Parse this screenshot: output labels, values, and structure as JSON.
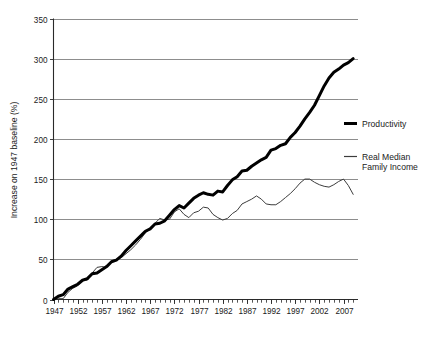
{
  "chart_data": {
    "type": "line",
    "title": "",
    "xlabel": "",
    "ylabel": "Increase on 1947 baseline (%)",
    "ylim": [
      0,
      350
    ],
    "xlim": [
      1947,
      2010
    ],
    "ytick_values": [
      0,
      50,
      100,
      150,
      200,
      250,
      300,
      350
    ],
    "ytick_labels": [
      "0",
      "50",
      "100",
      "150",
      "200",
      "250",
      "300",
      "350"
    ],
    "xtick_values": [
      1947,
      1952,
      1957,
      1962,
      1967,
      1972,
      1977,
      1982,
      1987,
      1992,
      1997,
      2002,
      2007
    ],
    "xtick_labels": [
      "1947",
      "1952",
      "1957",
      "1962",
      "1967",
      "1972",
      "1977",
      "1982",
      "1987",
      "1992",
      "1997",
      "2002",
      "2007"
    ],
    "minor_ticks": "every year",
    "grid": "horizontal",
    "legend_position": "right",
    "x": [
      1947,
      1948,
      1949,
      1950,
      1951,
      1952,
      1953,
      1954,
      1955,
      1956,
      1957,
      1958,
      1959,
      1960,
      1961,
      1962,
      1963,
      1964,
      1965,
      1966,
      1967,
      1968,
      1969,
      1970,
      1971,
      1972,
      1973,
      1974,
      1975,
      1976,
      1977,
      1978,
      1979,
      1980,
      1981,
      1982,
      1983,
      1984,
      1985,
      1986,
      1987,
      1988,
      1989,
      1990,
      1991,
      1992,
      1993,
      1994,
      1995,
      1996,
      1997,
      1998,
      1999,
      2000,
      2001,
      2002,
      2003,
      2004,
      2005,
      2006,
      2007,
      2008,
      2009
    ],
    "series": [
      {
        "name": "Productivity",
        "style": "thick-black",
        "color": "#000000",
        "values": [
          0,
          4,
          6,
          13,
          16,
          19,
          24,
          26,
          32,
          33,
          37,
          41,
          47,
          49,
          54,
          61,
          67,
          73,
          79,
          85,
          88,
          94,
          95,
          98,
          105,
          112,
          117,
          114,
          120,
          126,
          130,
          133,
          131,
          130,
          135,
          134,
          142,
          149,
          153,
          160,
          161,
          166,
          170,
          174,
          177,
          186,
          188,
          192,
          194,
          202,
          208,
          216,
          225,
          233,
          242,
          254,
          266,
          276,
          283,
          287,
          292,
          295,
          300
        ]
      },
      {
        "name": "Real Median Family Income",
        "style": "thin-gray",
        "color": "#3c3c3c",
        "values": [
          0,
          1,
          1,
          9,
          14,
          17,
          24,
          24,
          33,
          40,
          41,
          40,
          48,
          50,
          52,
          57,
          62,
          68,
          75,
          83,
          88,
          95,
          101,
          99,
          100,
          109,
          113,
          106,
          102,
          108,
          110,
          115,
          114,
          106,
          102,
          99,
          101,
          107,
          111,
          119,
          122,
          125,
          129,
          125,
          119,
          118,
          118,
          122,
          127,
          132,
          138,
          145,
          150,
          150,
          146,
          143,
          141,
          140,
          143,
          147,
          150,
          142,
          131
        ]
      }
    ],
    "legend": [
      {
        "label": "Productivity",
        "style": "thick-black"
      },
      {
        "label": "Real Median\nFamily Income",
        "label_line1": "Real Median",
        "label_line2": "Family Income",
        "style": "thin-gray"
      }
    ]
  },
  "axis": {
    "y_title": "Increase on 1947 baseline (%)"
  },
  "legend": {
    "productivity_label": "Productivity",
    "income_label_line1": "Real Median",
    "income_label_line2": "Family Income"
  },
  "colors": {
    "productivity": "#000000",
    "income": "#3c3c3c",
    "gridline": "#808080",
    "axis": "#2a2a2a",
    "background": "#ffffff"
  }
}
